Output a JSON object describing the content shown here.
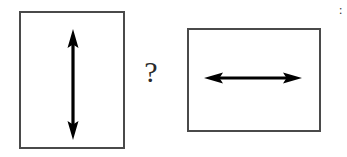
{
  "figure": {
    "background_color": "#ffffff",
    "stroke_color": "#4a4a4a",
    "arrow_color": "#000000",
    "width": 347,
    "height": 157
  },
  "left_panel": {
    "name": "portrait-frame",
    "orientation": "portrait",
    "arrow": {
      "direction": "vertical",
      "style": "double-headed",
      "label": ""
    }
  },
  "right_panel": {
    "name": "landscape-frame",
    "orientation": "landscape",
    "arrow": {
      "direction": "horizontal",
      "style": "double-headed",
      "label": ""
    }
  },
  "comparator": {
    "symbol": "?",
    "meaning": "question-mark-between-panels"
  },
  "edge_fragment": {
    "symbol": ":"
  }
}
